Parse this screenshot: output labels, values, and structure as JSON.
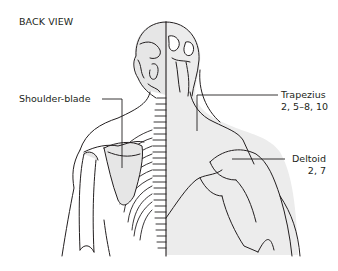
{
  "title": "BACK VIEW",
  "labels": {
    "shoulder_blade": {
      "name": "Shoulder-blade"
    },
    "trapezius": {
      "name": "Trapezius",
      "refs": "2, 5–8, 10"
    },
    "deltoid": {
      "name": "Deltoid",
      "refs": "2, 7"
    }
  },
  "colors": {
    "line": "#231f20",
    "shade": "#e6e6e6",
    "background": "#ffffff"
  }
}
